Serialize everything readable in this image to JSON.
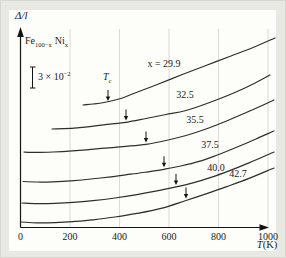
{
  "figure": {
    "ylabel": "Δ/l",
    "sample": {
      "fe": "Fe",
      "fe_sub": "100−x",
      "ni": "Ni",
      "ni_sub": "x"
    },
    "scale_bar": {
      "coeff": "3 × 10",
      "exp": "−2"
    },
    "tc": {
      "base": "T",
      "sub": "c"
    },
    "xlabel": {
      "var": "T",
      "unit": "(K)"
    },
    "x_ticks": [
      {
        "K": 0,
        "label": "0"
      },
      {
        "K": 200,
        "label": "200"
      },
      {
        "K": 400,
        "label": "400"
      },
      {
        "K": 600,
        "label": "600"
      },
      {
        "K": 800,
        "label": "800"
      },
      {
        "K": 1000,
        "label": "1000"
      }
    ],
    "colors": {
      "outer_bg": "#e9e9e3",
      "plot_bg": "#fdfdfa",
      "curve": "#2e2e2e",
      "grid": "#dbdbd3",
      "axis": "#141414",
      "text": "#1b1b1b"
    }
  },
  "chart_data": {
    "type": "line",
    "xlabel": "T (K)",
    "ylabel": "Δ/l (relative elongation)",
    "x_range_K": [
      0,
      1000
    ],
    "y_axis_note": "no absolute scale; vertical scale bar = 3 × 10⁻²",
    "gridlines_K": [
      200,
      400,
      600,
      800,
      1000
    ],
    "series": [
      {
        "label": "x = 29.9",
        "x_value": 29.9,
        "Tc_K": 355,
        "label_pos": [
          163,
          62
        ],
        "tc_arrow_px": [
          107,
          100
        ],
        "points_px": [
          [
            82,
            104
          ],
          [
            92,
            103
          ],
          [
            103,
            101.5
          ],
          [
            118,
            98
          ],
          [
            134,
            92
          ],
          [
            155,
            84
          ],
          [
            180,
            74
          ],
          [
            205,
            64.5
          ],
          [
            230,
            55
          ],
          [
            252,
            46.5
          ],
          [
            274,
            37
          ]
        ]
      },
      {
        "label": "32.5",
        "x_value": 32.5,
        "Tc_K": 425,
        "label_pos": [
          184,
          93
        ],
        "tc_arrow_px": [
          125,
          119.5
        ],
        "points_px": [
          [
            51,
            128
          ],
          [
            63,
            127.6
          ],
          [
            76,
            126.8
          ],
          [
            91,
            125.3
          ],
          [
            106,
            123.3
          ],
          [
            125,
            121.3
          ],
          [
            145,
            117.5
          ],
          [
            165,
            113.5
          ],
          [
            185,
            109.5
          ],
          [
            210,
            101
          ],
          [
            235,
            91
          ],
          [
            255,
            81.5
          ],
          [
            269,
            74
          ]
        ]
      },
      {
        "label": "35.5",
        "x_value": 35.5,
        "Tc_K": 505,
        "label_pos": [
          194,
          118
        ],
        "tc_arrow_px": [
          145,
          141.5
        ],
        "points_px": [
          [
            23,
            151
          ],
          [
            36,
            151.4
          ],
          [
            52,
            151
          ],
          [
            68,
            150.2
          ],
          [
            85,
            148.8
          ],
          [
            103,
            147.2
          ],
          [
            122,
            145.6
          ],
          [
            145,
            143.3
          ],
          [
            165,
            139.5
          ],
          [
            185,
            134.5
          ],
          [
            205,
            128
          ],
          [
            228,
            119
          ],
          [
            250,
            109.5
          ],
          [
            273,
            99
          ]
        ]
      },
      {
        "label": "37.5",
        "x_value": 37.5,
        "Tc_K": 580,
        "label_pos": [
          209,
          143
        ],
        "tc_arrow_px": [
          163,
          166.3
        ],
        "points_px": [
          [
            22,
            180.5
          ],
          [
            36,
            181
          ],
          [
            52,
            180.8
          ],
          [
            70,
            179.8
          ],
          [
            90,
            178
          ],
          [
            110,
            175.8
          ],
          [
            130,
            173.2
          ],
          [
            147,
            170.8
          ],
          [
            163,
            168.3
          ],
          [
            180,
            165
          ],
          [
            198,
            160.4
          ],
          [
            215,
            154.5
          ],
          [
            235,
            146.5
          ],
          [
            255,
            138
          ],
          [
            273,
            130
          ]
        ]
      },
      {
        "label": "40.0",
        "x_value": 40.0,
        "Tc_K": 630,
        "label_pos": [
          215,
          166
        ],
        "tc_arrow_px": [
          175,
          183.9
        ],
        "points_px": [
          [
            21,
            202
          ],
          [
            36,
            202.6
          ],
          [
            54,
            202.4
          ],
          [
            72,
            201.4
          ],
          [
            92,
            199.6
          ],
          [
            114,
            197
          ],
          [
            136,
            193.6
          ],
          [
            156,
            189.9
          ],
          [
            175,
            185.9
          ],
          [
            192,
            181.9
          ],
          [
            210,
            176.4
          ],
          [
            228,
            169.9
          ],
          [
            248,
            161.9
          ],
          [
            273,
            151
          ]
        ]
      },
      {
        "label": "42.7",
        "x_value": 42.7,
        "Tc_K": 670,
        "label_pos": [
          237,
          172
        ],
        "tc_arrow_px": [
          185,
          197.5
        ],
        "points_px": [
          [
            20,
            221
          ],
          [
            36,
            221.8
          ],
          [
            54,
            221.6
          ],
          [
            72,
            220.6
          ],
          [
            92,
            218.8
          ],
          [
            114,
            216
          ],
          [
            136,
            212.4
          ],
          [
            160,
            207.4
          ],
          [
            185,
            199.5
          ],
          [
            205,
            192.9
          ],
          [
            225,
            185.9
          ],
          [
            248,
            177.4
          ],
          [
            273,
            167
          ]
        ]
      }
    ]
  }
}
